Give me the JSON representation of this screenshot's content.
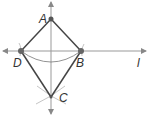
{
  "diagram": {
    "type": "geometry-construction",
    "points": [
      {
        "id": "A",
        "label": "A",
        "x": 51,
        "y": 19
      },
      {
        "id": "B",
        "label": "B",
        "x": 81,
        "y": 51
      },
      {
        "id": "C",
        "label": "C",
        "x": 51,
        "y": 97
      },
      {
        "id": "D",
        "label": "D",
        "x": 21,
        "y": 51
      }
    ],
    "line_label": "l",
    "segments": [
      "AB",
      "BC",
      "CD",
      "DA"
    ],
    "colors": {
      "segment": "#444444",
      "axis": "#999999",
      "arc": "#777777",
      "point": "#555555"
    }
  }
}
